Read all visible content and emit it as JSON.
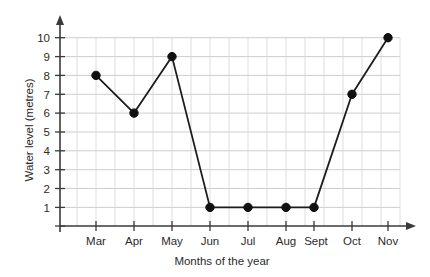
{
  "chart_data": {
    "type": "line",
    "title": "",
    "subtitle": "",
    "xlabel": "Months of the year",
    "ylabel": "Water level (metres)",
    "categories": [
      "Mar",
      "Apr",
      "May",
      "Jun",
      "Jul",
      "Aug",
      "Sept",
      "Oct",
      "Nov"
    ],
    "values": [
      8,
      6,
      9,
      1,
      1,
      1,
      1,
      7,
      10
    ],
    "series": [
      {
        "name": "Water level",
        "values": [
          8,
          6,
          9,
          1,
          1,
          1,
          1,
          7,
          10
        ]
      }
    ],
    "ylim": [
      0,
      10.6
    ],
    "yticks": [
      1,
      2,
      3,
      4,
      5,
      6,
      7,
      8,
      9,
      10
    ],
    "ytick_labels": [
      "1",
      "2",
      "3",
      "4",
      "5",
      "6",
      "7",
      "8",
      "9",
      "10"
    ],
    "xtick_labels": [
      "Mar",
      "Apr",
      "May",
      "Jun",
      "Jul",
      "Aug",
      "Sept",
      "Oct",
      "Nov"
    ],
    "grid": true,
    "grid_minor_x": true,
    "legend": false,
    "legend_position": "none",
    "marker": "filled-circle",
    "line_color": "#1c1c1c",
    "marker_color": "#111111",
    "grid_color": "#d2d6da",
    "axis_color": "#3a3a3a",
    "background_color": "#ffffff",
    "annotations": []
  },
  "axes": {
    "y_axis_title": "Water level (metres)",
    "x_axis_title": "Months of the year",
    "y_arrow": "arrow-up",
    "x_arrow": "arrow-right"
  }
}
